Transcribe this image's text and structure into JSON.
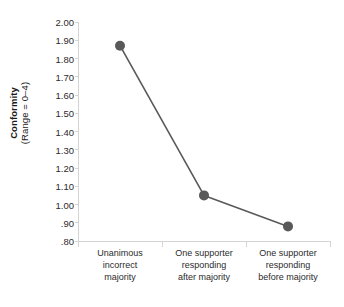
{
  "chart_data": {
    "type": "line",
    "title": "",
    "xlabel": "",
    "ylabel": "Conformity (Range = 0-4)",
    "ylabel_main": "Conformity",
    "ylabel_sub": "(Range = 0–4)",
    "categories": [
      "Unanimous incorrect majority",
      "One supporter responding after majority",
      "One supporter responding before majority"
    ],
    "category_lines": [
      [
        "Unanimous",
        "incorrect",
        "majority"
      ],
      [
        "One supporter",
        "responding",
        "after majority"
      ],
      [
        "One supporter",
        "responding",
        "before majority"
      ]
    ],
    "values": [
      1.87,
      1.05,
      0.88
    ],
    "ylim": [
      0.8,
      2.0
    ],
    "ytick_step": 0.1,
    "ytick_labels": [
      "2.00",
      "1.90",
      "1.80",
      "1.70",
      "1.60",
      "1.50",
      "1.40",
      "1.30",
      "1.20",
      "1.10",
      "1.00",
      ".90",
      ".80"
    ],
    "ytick_values": [
      2.0,
      1.9,
      1.8,
      1.7,
      1.6,
      1.5,
      1.4,
      1.3,
      1.2,
      1.1,
      1.0,
      0.9,
      0.8
    ],
    "grid": false,
    "legend": false,
    "series": [
      {
        "name": "Conformity",
        "values": [
          1.87,
          1.05,
          0.88
        ]
      }
    ],
    "colors": {
      "marker": "#595959",
      "line": "#595959",
      "axis": "#d4d4d4",
      "text": "#2b2b2b",
      "background": "#ffffff"
    },
    "marker_radius": 5,
    "line_width": 1.6
  }
}
